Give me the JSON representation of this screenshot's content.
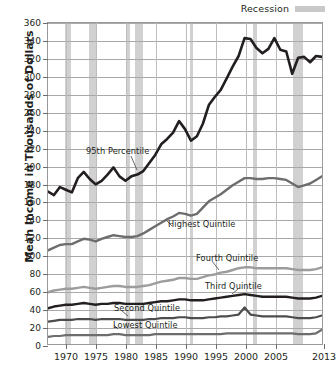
{
  "legend": {
    "label": "Recession",
    "swatch_color": "#c9c9c9",
    "swatch_name": "recession-swatch"
  },
  "axes": {
    "ylabel": "Mean Income in Thousands of Dollars",
    "xlabel": "",
    "yticks": [
      0,
      20,
      40,
      60,
      80,
      100,
      120,
      140,
      160,
      180,
      200,
      220,
      240,
      260,
      280,
      300,
      320,
      340,
      360
    ],
    "ytick_labels": [
      "0",
      "20",
      "40",
      "60",
      "80",
      "100",
      "120",
      "140",
      "160",
      "180",
      "200",
      "220",
      "240",
      "260",
      "280",
      "300",
      "320",
      "340",
      "360"
    ],
    "xticks": [
      1970,
      1975,
      1980,
      1985,
      1990,
      1995,
      2000,
      2005,
      2013
    ],
    "xtick_labels": [
      "1970",
      "1975",
      "1980",
      "1985",
      "1990",
      "1995",
      "2000",
      "2005",
      "2013"
    ]
  },
  "annotations": {
    "p95": "95th Percentile",
    "highest": "Highest  Quintile",
    "fourth": "Fourth Quintile",
    "third": "Third Quintile",
    "second": "Second Quintile",
    "lowest": "Lowest Quintile"
  },
  "chart_data": {
    "type": "line",
    "title": "",
    "subtitle": "",
    "xlabel": "",
    "ylabel": "Mean Income in Thousands of Dollars",
    "xlim": [
      1967,
      2013
    ],
    "ylim": [
      0,
      360
    ],
    "grid": true,
    "legend_position": "top-right",
    "tick_years": [
      1970,
      1975,
      1980,
      1985,
      1990,
      1995,
      2000,
      2005,
      2013
    ],
    "recession_bands": [
      {
        "start": 1969.9,
        "end": 1970.9
      },
      {
        "start": 1973.9,
        "end": 1975.2
      },
      {
        "start": 1980.0,
        "end": 1980.6
      },
      {
        "start": 1981.5,
        "end": 1982.9
      },
      {
        "start": 1990.6,
        "end": 1991.2
      },
      {
        "start": 2001.2,
        "end": 2001.9
      },
      {
        "start": 2007.9,
        "end": 2009.5
      }
    ],
    "x": [
      1967,
      1968,
      1969,
      1970,
      1971,
      1972,
      1973,
      1974,
      1975,
      1976,
      1977,
      1978,
      1979,
      1980,
      1981,
      1982,
      1983,
      1984,
      1985,
      1986,
      1987,
      1988,
      1989,
      1990,
      1991,
      1992,
      1993,
      1994,
      1995,
      1996,
      1997,
      1998,
      1999,
      2000,
      2001,
      2002,
      2003,
      2004,
      2005,
      2006,
      2007,
      2008,
      2009,
      2010,
      2011,
      2012,
      2013
    ],
    "series": [
      {
        "name": "95th Percentile",
        "color": "#231f20",
        "width": 2.6,
        "values": [
          171,
          167,
          176,
          173,
          170,
          186,
          193,
          185,
          179,
          183,
          190,
          198,
          188,
          183,
          188,
          190,
          194,
          203,
          212,
          224,
          230,
          237,
          250,
          241,
          228,
          233,
          247,
          268,
          277,
          285,
          298,
          311,
          323,
          343,
          342,
          332,
          326,
          331,
          343,
          330,
          328,
          303,
          321,
          322,
          316,
          323,
          322
        ]
      },
      {
        "name": "Highest Quintile",
        "color": "#6d6d6d",
        "width": 2.4,
        "values": [
          105,
          108,
          111,
          112,
          112,
          115,
          118,
          117,
          115,
          118,
          120,
          122,
          121,
          120,
          120,
          121,
          124,
          128,
          132,
          136,
          140,
          143,
          147,
          146,
          144,
          146,
          153,
          160,
          164,
          168,
          173,
          178,
          182,
          186,
          186,
          185,
          185,
          186,
          186,
          185,
          184,
          180,
          176,
          178,
          180,
          184,
          188
        ]
      },
      {
        "name": "Fourth Quintile",
        "color": "#9c9c9c",
        "width": 2.4,
        "values": [
          58,
          60,
          61,
          62,
          62,
          63,
          64,
          63,
          62,
          63,
          64,
          65,
          65,
          64,
          64,
          64,
          65,
          66,
          68,
          70,
          71,
          72,
          74,
          74,
          73,
          73,
          75,
          77,
          78,
          80,
          81,
          83,
          85,
          86,
          86,
          85,
          85,
          85,
          85,
          85,
          85,
          84,
          83,
          83,
          83,
          84,
          86
        ]
      },
      {
        "name": "Third Quintile",
        "color": "#231f20",
        "width": 2.4,
        "values": [
          40,
          42,
          43,
          44,
          44,
          45,
          46,
          45,
          44,
          45,
          45,
          46,
          46,
          45,
          45,
          45,
          45,
          46,
          47,
          48,
          48,
          49,
          50,
          50,
          49,
          49,
          49,
          50,
          51,
          52,
          53,
          54,
          55,
          56,
          55,
          54,
          53,
          53,
          53,
          53,
          53,
          52,
          51,
          51,
          51,
          52,
          54
        ]
      },
      {
        "name": "Second Quintile",
        "color": "#4d4d4d",
        "width": 2.2,
        "values": [
          25,
          26,
          27,
          27,
          27,
          28,
          28,
          28,
          27,
          28,
          28,
          28,
          28,
          27,
          27,
          27,
          27,
          28,
          28,
          29,
          29,
          29,
          30,
          30,
          29,
          29,
          29,
          30,
          30,
          31,
          31,
          32,
          33,
          41,
          33,
          32,
          31,
          31,
          31,
          31,
          31,
          30,
          29,
          29,
          29,
          30,
          32
        ]
      },
      {
        "name": "Lowest Quintile",
        "color": "#6d6d6d",
        "width": 2.2,
        "values": [
          8,
          9,
          9,
          10,
          10,
          10,
          10,
          10,
          10,
          10,
          10,
          11,
          11,
          10,
          10,
          10,
          10,
          10,
          11,
          11,
          11,
          11,
          11,
          11,
          11,
          11,
          11,
          11,
          11,
          11,
          12,
          12,
          12,
          12,
          12,
          12,
          12,
          12,
          12,
          12,
          12,
          12,
          11,
          11,
          11,
          12,
          16
        ]
      }
    ]
  }
}
